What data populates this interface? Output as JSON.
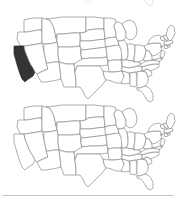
{
  "page": {
    "background_color": "#ffffff",
    "width": 176,
    "height": 205
  },
  "colors": {
    "background": "#ffffff",
    "state_fill": "#ffffff",
    "state_stroke": "#8d8d8d",
    "highlight_fill": "#343434",
    "highlight_stroke": "#2a2a2a",
    "divider": "#c9c9c9"
  },
  "maps": [
    {
      "id": "map-top",
      "label": "US map with California highlighted",
      "region": "Contiguous United States",
      "highlighted_states": [
        "CA"
      ],
      "highlighted_state_names": [
        "California"
      ],
      "fill_color": "#343434"
    },
    {
      "id": "map-bottom",
      "label": "US map with no state highlighted",
      "region": "Contiguous United States",
      "highlighted_states": [],
      "highlighted_state_names": [],
      "fill_color": "#ffffff"
    }
  ],
  "fragment": {
    "id": "map-fragment-top",
    "label": "Partially cropped US map above the first full map"
  },
  "divider": {
    "id": "bottom-divider",
    "label": "Horizontal rule",
    "color": "#c9c9c9"
  },
  "state_paths": {
    "WA": "M24,13 L24,12 L28,11 L33,10 L38,10 L42,10 L42,19 L41,22 L38,22 L33,23 L27,24 L24,24 Z",
    "OR": "M18,24 L24,24 L27,24 L33,23 L38,22 L41,22 L42,24 L42,35 L38,36 L31,37 L24,38 L20,38 L19,35 L17,31 Z",
    "CA": "M14,38 L20,38 L24,38 L25,43 L27,48 L29,53 L31,57 L33,60 L35,64 L33,68 L30,70 L27,72 L25,74 L22,71 L20,66 L18,60 L16,53 L14,46 Z",
    "NV": "M24,38 L31,37 L38,36 L42,35 L44,44 L46,53 L48,61 L45,62 L41,64 L37,66 L35,64 L33,60 L31,57 L29,53 L27,48 L25,43 Z",
    "ID": "M42,10 L46,11 L50,12 L52,16 L54,20 L55,25 L56,30 L57,34 L54,35 L48,36 L44,36 L42,35 L42,24 L42,19 Z",
    "MT": "M46,11 L54,10 L62,9 L70,9 L78,9 L86,9 L86,24 L80,25 L72,25 L64,26 L57,26 L56,30 L55,25 L54,20 L52,16 L50,12 Z",
    "WY": "M57,26 L64,26 L72,25 L80,25 L80,38 L72,39 L64,39 L58,39 L57,34 Z",
    "UT": "M44,36 L48,36 L54,35 L57,34 L58,39 L58,46 L59,54 L54,54 L49,55 L46,55 L46,53 L44,44 Z",
    "AZ": "M46,55 L49,55 L54,54 L59,54 L60,62 L61,71 L57,72 L52,73 L46,74 L41,74 L39,70 L37,66 L41,64 L45,62 L48,61 Z",
    "CO": "M58,39 L64,39 L72,39 L80,38 L81,47 L82,55 L74,56 L66,56 L59,54 L58,46 Z",
    "NM": "M59,54 L66,56 L74,56 L75,64 L76,73 L76,79 L70,79 L64,79 L61,71 L60,62 Z",
    "ND": "M86,9 L94,9 L102,10 L104,10 L104,21 L96,21 L88,22 L86,24 Z",
    "SD": "M86,24 L88,22 L96,21 L104,21 L105,31 L97,32 L89,33 L81,33 L80,25 Z",
    "NE": "M80,33 L89,33 L97,32 L105,31 L106,39 L99,40 L91,41 L82,42 L80,38 Z",
    "KS": "M81,42 L91,41 L99,40 L106,39 L107,49 L99,50 L90,50 L82,51 L81,47 Z",
    "OK": "M82,51 L90,50 L99,50 L107,49 L108,57 L100,58 L92,58 L84,58 L77,58 L75,64 L74,56 Z",
    "TX": "M75,64 L77,58 L84,58 L92,58 L100,58 L103,63 L104,68 L106,72 L103,76 L99,80 L95,84 L91,88 L88,91 L85,88 L83,83 L80,79 L76,79 L76,73 Z",
    "MN": "M104,10 L110,10 L115,11 L116,14 L114,18 L115,22 L116,25 L116,29 L108,30 L105,31 L104,21 Z",
    "IA": "M105,31 L108,30 L116,29 L118,33 L119,37 L112,38 L106,39 L105,35 Z",
    "MO": "M106,39 L112,38 L119,37 L121,41 L123,44 L122,48 L121,52 L113,52 L108,53 L107,49 Z",
    "AR": "M108,53 L113,52 L121,52 L122,58 L122,63 L115,64 L109,64 L108,57 Z",
    "LA": "M109,64 L115,64 L122,63 L124,68 L125,73 L121,75 L116,75 L111,73 L108,72 L106,72 L104,68 L103,63 Z",
    "WI": "M116,14 L119,14 L122,16 L124,20 L126,24 L126,29 L124,32 L120,33 L118,33 L116,29 L116,25 L115,22 L114,18 Z",
    "IL": "M118,33 L120,33 L124,32 L127,36 L128,42 L128,48 L126,52 L122,52 L121,41 L119,37 Z",
    "MI": "M122,16 L126,13 L130,12 L134,14 L136,18 L137,23 L136,28 L133,31 L129,32 L126,29 L126,24 L124,20 Z",
    "IN": "M126,52 L128,48 L128,42 L127,36 L132,36 L135,37 L135,44 L134,50 L133,53 Z",
    "OH": "M135,37 L140,37 L144,38 L146,42 L145,48 L143,52 L139,54 L134,54 L134,50 L135,44 Z",
    "KY": "M122,52 L126,52 L133,53 L134,54 L139,54 L141,56 L138,58 L134,59 L129,60 L124,59 L122,58 Z",
    "TN": "M122,58 L124,59 L129,60 L134,59 L138,58 L142,59 L142,63 L136,64 L129,65 L122,63 Z",
    "MS": "M122,63 L129,65 L130,70 L130,75 L125,76 L121,75 L124,68 Z",
    "AL": "M130,65 L136,64 L137,70 L137,76 L135,79 L130,78 L130,75 L130,70 Z",
    "GA": "M137,64 L142,63 L146,64 L148,69 L148,74 L145,78 L140,80 L137,80 L137,76 L137,70 Z",
    "FL": "M137,80 L140,80 L145,78 L148,79 L151,82 L153,87 L153,92 L150,94 L147,92 L144,87 L141,83 L137,82 Z",
    "SC": "M142,63 L147,61 L151,63 L152,67 L148,69 L146,64 Z",
    "NC": "M142,59 L148,57 L154,56 L159,56 L159,59 L155,61 L151,63 L147,61 L142,63 Z",
    "VA": "M141,56 L146,53 L152,52 L157,51 L160,52 L159,56 L154,56 L148,57 L142,59 L139,54 Z",
    "WV": "M143,52 L145,48 L146,42 L149,43 L151,46 L152,49 L152,52 L146,53 Z",
    "MD": "M152,52 L157,51 L160,50 L162,51 L160,53 L157,53 Z",
    "DE": "M160,48 L162,48 L163,51 L161,51 Z",
    "PA": "M144,38 L148,36 L154,35 L160,35 L162,39 L161,43 L158,46 L153,48 L151,46 L149,43 L146,42 Z",
    "NJ": "M161,43 L163,42 L165,44 L164,48 L162,50 L160,48 L161,45 Z",
    "NY": "M148,36 L150,31 L154,28 L159,27 L162,29 L164,32 L166,35 L163,38 L160,39 L162,39 L160,35 L154,35 Z",
    "CT": "M164,38 L167,37 L168,40 L165,41 Z",
    "RI": "M168,37 L170,36 L170,39 L168,39 Z",
    "MA": "M164,34 L168,33 L172,32 L173,35 L170,36 L167,37 L164,36 Z",
    "VT": "M160,29 L163,28 L165,31 L163,33 L161,32 Z",
    "NH": "M163,28 L166,27 L168,31 L167,33 L165,31 Z",
    "ME": "M166,27 L168,20 L171,17 L174,19 L175,25 L173,30 L170,33 L168,31 Z"
  }
}
